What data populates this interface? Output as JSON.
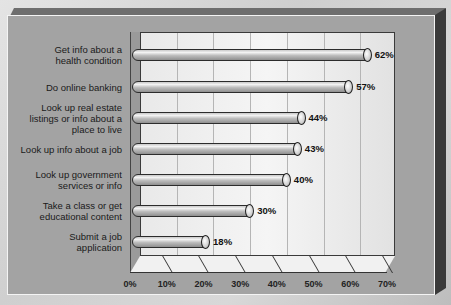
{
  "chart_data": {
    "type": "bar",
    "orientation": "horizontal",
    "title": "",
    "xlabel": "",
    "ylabel": "",
    "categories": [
      "Get info about a health condition",
      "Do online banking",
      "Look up real estate listings or info about a place to live",
      "Look up info about a job",
      "Look up government services or info",
      "Take a class or get educational content",
      "Submit a job application"
    ],
    "values": [
      62,
      57,
      44,
      43,
      40,
      30,
      18
    ],
    "value_labels": [
      "62%",
      "57%",
      "44%",
      "43%",
      "40%",
      "30%",
      "18%"
    ],
    "xlim": [
      0,
      70
    ],
    "x_ticks": [
      "0%",
      "10%",
      "20%",
      "30%",
      "40%",
      "50%",
      "60%",
      "70%"
    ],
    "grid": true,
    "legend": null,
    "style": "3D cylinder bars"
  },
  "labels": {
    "cat0": [
      "Get info about a",
      "health condition"
    ],
    "cat1": [
      "Do online banking"
    ],
    "cat2": [
      "Look up real estate",
      "listings or info about a",
      "place to live"
    ],
    "cat3": [
      "Look up info about a job"
    ],
    "cat4": [
      "Look up government",
      "services or info"
    ],
    "cat5": [
      "Take a class or get",
      "educational content"
    ],
    "cat6": [
      "Submit a job",
      "application"
    ]
  }
}
